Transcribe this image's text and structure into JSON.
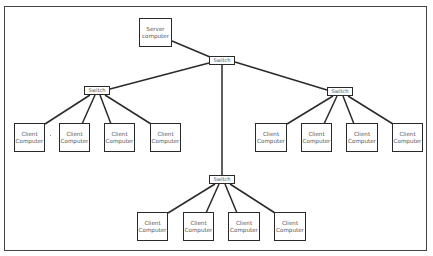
{
  "diagram": {
    "type": "network-topology",
    "colors": {
      "line": "#2a2a2a",
      "text": "#555555",
      "border": "#444444",
      "background": "#ffffff"
    },
    "server": {
      "line1": "Server",
      "line2": "computer",
      "box": [
        139,
        18,
        33,
        29
      ]
    },
    "switches": [
      {
        "id": "main",
        "label": "Switch",
        "box": [
          209,
          56,
          26,
          9
        ]
      },
      {
        "id": "left",
        "label": "Switch",
        "box": [
          84,
          86,
          26,
          9
        ]
      },
      {
        "id": "right",
        "label": "Switch",
        "box": [
          327,
          87,
          26,
          9
        ]
      },
      {
        "id": "bottom",
        "label": "Switch",
        "box": [
          209,
          175,
          26,
          9
        ]
      }
    ],
    "clients": {
      "left": [
        {
          "line1": "Client",
          "line2": "Computer",
          "box": [
            14,
            123,
            31,
            29
          ]
        },
        {
          "line1": "Client",
          "line2": "Computer",
          "box": [
            59,
            123,
            31,
            29
          ]
        },
        {
          "line1": "Client",
          "line2": "Computer",
          "box": [
            104,
            123,
            31,
            29
          ]
        },
        {
          "line1": "Client",
          "line2": "Computer",
          "box": [
            150,
            123,
            31,
            29
          ]
        }
      ],
      "right": [
        {
          "line1": "Client",
          "line2": "Computer",
          "box": [
            255,
            123,
            32,
            29
          ]
        },
        {
          "line1": "Client",
          "line2": "Computer",
          "box": [
            301,
            123,
            31,
            29
          ]
        },
        {
          "line1": "Client",
          "line2": "Computer",
          "box": [
            346,
            123,
            32,
            29
          ]
        },
        {
          "line1": "Client",
          "line2": "Computer",
          "box": [
            392,
            123,
            31,
            29
          ]
        }
      ],
      "bottom": [
        {
          "line1": "Client",
          "line2": "Computer",
          "box": [
            137,
            212,
            31,
            29
          ]
        },
        {
          "line1": "Client",
          "line2": "Computer",
          "box": [
            183,
            212,
            31,
            29
          ]
        },
        {
          "line1": "Client",
          "line2": "Computer",
          "box": [
            228,
            212,
            32,
            29
          ]
        },
        {
          "line1": "Client",
          "line2": "Computer",
          "box": [
            274,
            212,
            32,
            29
          ]
        }
      ]
    },
    "links": [
      [
        172,
        41,
        210,
        57
      ],
      [
        209,
        63,
        110,
        89
      ],
      [
        235,
        62,
        327,
        90
      ],
      [
        222,
        65,
        222,
        175
      ],
      [
        90,
        95,
        45,
        124
      ],
      [
        95,
        95,
        82,
        124
      ],
      [
        100,
        95,
        111,
        124
      ],
      [
        105,
        95,
        151,
        124
      ],
      [
        333,
        96,
        287,
        124
      ],
      [
        337,
        96,
        324,
        124
      ],
      [
        343,
        96,
        354,
        124
      ],
      [
        348,
        96,
        393,
        124
      ],
      [
        215,
        184,
        168,
        213
      ],
      [
        219,
        184,
        206,
        213
      ],
      [
        225,
        184,
        237,
        213
      ],
      [
        230,
        184,
        275,
        213
      ]
    ]
  }
}
